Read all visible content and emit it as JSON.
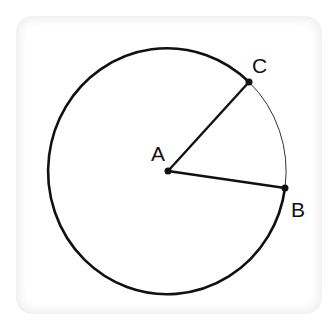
{
  "diagram": {
    "type": "circle-sector",
    "points": [
      {
        "name": "A",
        "role": "center",
        "label": "A"
      },
      {
        "name": "B",
        "role": "on-circle",
        "label": "B"
      },
      {
        "name": "C",
        "role": "on-circle",
        "label": "C"
      }
    ],
    "segments": [
      "AC",
      "AB"
    ],
    "arcs": [
      {
        "from": "C",
        "to": "B",
        "kind": "minor",
        "style": "thin"
      },
      {
        "from": "B",
        "to": "C",
        "kind": "major",
        "style": "thick"
      }
    ],
    "colors": {
      "stroke": "#111111",
      "background": "#ffffff",
      "card_edge": "#efefef"
    }
  }
}
